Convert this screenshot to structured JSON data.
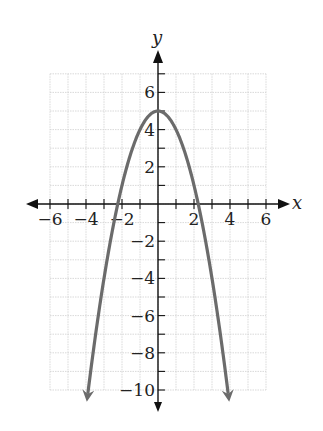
{
  "chart_data": {
    "type": "line",
    "title": "",
    "xlabel": "x",
    "ylabel": "y",
    "xlim": [
      -6,
      6
    ],
    "ylim": [
      -10,
      7
    ],
    "grid": true,
    "x_ticks": [
      -6,
      -4,
      -2,
      2,
      4,
      6
    ],
    "y_ticks": [
      6,
      4,
      2,
      -2,
      -4,
      -6,
      -8,
      -10
    ],
    "x_tick_labels": [
      "−6",
      "−4",
      "−2",
      "2",
      "4",
      "6"
    ],
    "y_tick_labels": [
      "6",
      "4",
      "2",
      "−2",
      "−4",
      "−6",
      "−8",
      "−10"
    ],
    "series": [
      {
        "name": "y = 5 − x²",
        "a": -1,
        "b": 0,
        "c": 5,
        "x_range": [
          -3.9,
          3.9
        ],
        "color": "#6b6b6b",
        "arrows": "both-ends"
      }
    ],
    "vertex": [
      0,
      5
    ]
  }
}
